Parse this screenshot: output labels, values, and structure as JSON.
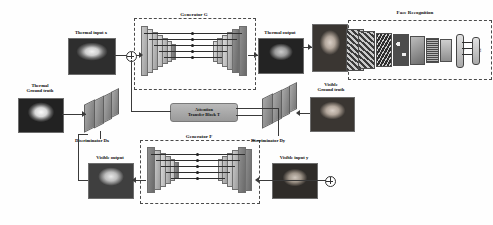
{
  "figure": {
    "type": "architecture-diagram",
    "domain": "thermal-to-visible face synthesis GAN"
  },
  "labels": {
    "generator_g": "Generator G",
    "generator_f": "Generator F",
    "attention_block": "Attention\nTransfer Block T",
    "discriminator_x": "Discriminator Dx",
    "discriminator_y": "Discriminator Dy",
    "face_recognition": "Face Recognition",
    "thermal_input": "Thermal input x",
    "thermal_output": "Thermal output",
    "thermal_ground_truth": "Thermal\nGround truth",
    "visible_input": "Visible input y",
    "visible_output": "Visible output",
    "visible_ground_truth": "Visible\nGround truth"
  },
  "face_recognition_layers": [
    {
      "name": "Input",
      "kind": "image"
    },
    {
      "name": "Conv1",
      "kind": "feature-map"
    },
    {
      "name": "Pool1",
      "kind": "feature-map"
    },
    {
      "name": "Conv2",
      "kind": "feature-map"
    },
    {
      "name": "Pool2",
      "kind": "feature-map"
    },
    {
      "name": "Conv3",
      "kind": "feature-map"
    },
    {
      "name": "Pool3",
      "kind": "feature-map"
    },
    {
      "name": "FC",
      "kind": "fully-connected"
    },
    {
      "name": "Output",
      "kind": "fully-connected"
    }
  ],
  "thumbnails": {
    "thermal_input": "thermal-face-input",
    "thermal_output": "thermal-face-output",
    "thermal_ground_truth": "thermal-face-ground-truth",
    "visible_input": "visible-face-input",
    "visible_output": "visible-face-output",
    "visible_ground_truth": "visible-face-ground-truth",
    "recognition_input": "visible-face-recognition-input"
  },
  "colors": {
    "background": "#ffffff",
    "line": "#3a3a3a",
    "dashed_box": "#4a4a4a",
    "attention_block": "#a8a8a8",
    "slab_light": "#dcdcdc",
    "slab_mid": "#c9c9c9",
    "slab_dark": "#8f8f8f"
  }
}
